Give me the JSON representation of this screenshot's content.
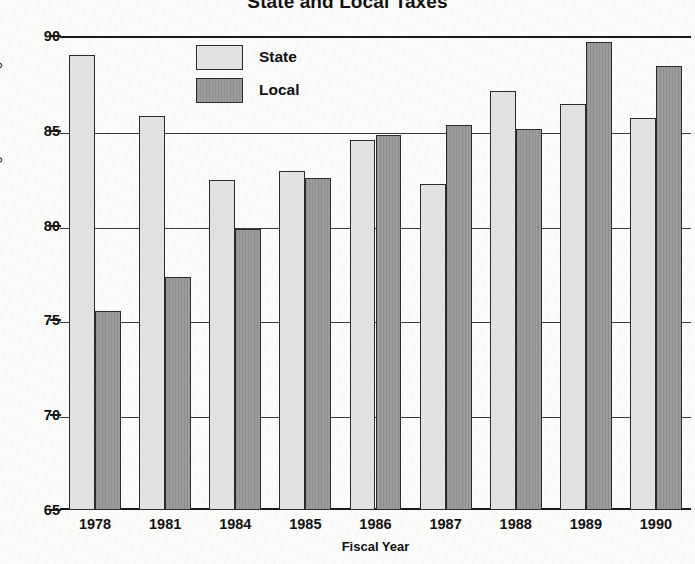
{
  "chart_data": {
    "type": "bar",
    "title": "State and Local Taxes",
    "xlabel": "Fiscal Year",
    "ylabel": "Percentage of U.S. Average",
    "categories": [
      "1978",
      "1981",
      "1984",
      "1985",
      "1986",
      "1987",
      "1988",
      "1989",
      "1990"
    ],
    "series": [
      {
        "name": "State",
        "color": "#e2e2e2",
        "values": [
          89.0,
          85.8,
          82.4,
          82.9,
          84.5,
          82.2,
          87.1,
          86.4,
          85.7
        ]
      },
      {
        "name": "Local",
        "color": "#9b9b9b",
        "values": [
          75.5,
          77.3,
          79.8,
          82.5,
          84.8,
          85.3,
          85.1,
          89.7,
          88.4
        ]
      }
    ],
    "ylim": [
      65,
      90
    ],
    "yticks": [
      90,
      85,
      80,
      75,
      70,
      65
    ],
    "grid": true,
    "legend_position": "top-center"
  },
  "legend": {
    "entries": [
      {
        "label": "State"
      },
      {
        "label": "Local"
      }
    ]
  }
}
